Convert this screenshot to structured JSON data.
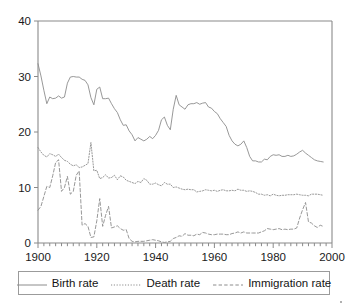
{
  "chart_data": {
    "type": "line",
    "title": "",
    "xlabel": "",
    "ylabel": "",
    "xlim": [
      1900,
      2000
    ],
    "ylim": [
      0,
      40
    ],
    "grid": false,
    "legend_position": "bottom",
    "x_ticks": [
      "1900",
      "1920",
      "1940",
      "1960",
      "1980",
      "2000"
    ],
    "x_tick_values": [
      1900,
      1920,
      1940,
      1960,
      1980,
      2000
    ],
    "y_ticks": [
      "0",
      "10",
      "20",
      "30",
      "40"
    ],
    "y_tick_values": [
      0,
      10,
      20,
      30,
      40
    ],
    "minor_x_tick_step": 2,
    "x": [
      1900,
      1901,
      1902,
      1903,
      1904,
      1905,
      1906,
      1907,
      1908,
      1909,
      1910,
      1911,
      1912,
      1913,
      1914,
      1915,
      1916,
      1917,
      1918,
      1919,
      1920,
      1921,
      1922,
      1923,
      1924,
      1925,
      1926,
      1927,
      1928,
      1929,
      1930,
      1931,
      1932,
      1933,
      1934,
      1935,
      1936,
      1937,
      1938,
      1939,
      1940,
      1941,
      1942,
      1943,
      1944,
      1945,
      1946,
      1947,
      1948,
      1949,
      1950,
      1951,
      1952,
      1953,
      1954,
      1955,
      1956,
      1957,
      1958,
      1959,
      1960,
      1961,
      1962,
      1963,
      1964,
      1965,
      1966,
      1967,
      1968,
      1969,
      1970,
      1971,
      1972,
      1973,
      1974,
      1975,
      1976,
      1977,
      1978,
      1979,
      1980,
      1981,
      1982,
      1983,
      1984,
      1985,
      1986,
      1987,
      1988,
      1989,
      1990,
      1991,
      1992,
      1993,
      1994,
      1995,
      1996,
      1997
    ],
    "series": [
      {
        "name": "Birth rate",
        "style": "solid",
        "values": [
          32.3,
          30.1,
          27.5,
          25.1,
          26.3,
          26.0,
          26.1,
          26.5,
          26.1,
          26.3,
          28.8,
          29.9,
          30.0,
          29.9,
          29.9,
          29.5,
          29.3,
          28.5,
          26.2,
          24.9,
          27.7,
          28.1,
          26.0,
          26.0,
          26.1,
          25.1,
          24.2,
          23.5,
          22.2,
          21.2,
          21.3,
          20.2,
          19.5,
          18.4,
          19.0,
          18.7,
          18.4,
          18.7,
          19.2,
          18.8,
          19.4,
          20.3,
          22.2,
          22.7,
          21.2,
          20.4,
          24.1,
          26.6,
          24.9,
          24.5,
          24.1,
          24.9,
          25.1,
          25.1,
          25.3,
          25.0,
          25.2,
          25.3,
          24.5,
          24.3,
          23.7,
          23.3,
          22.4,
          21.7,
          21.0,
          19.4,
          18.4,
          17.8,
          17.5,
          17.8,
          18.4,
          17.2,
          15.6,
          14.8,
          14.8,
          14.6,
          14.6,
          15.1,
          15.0,
          15.6,
          15.9,
          15.8,
          15.9,
          15.6,
          15.6,
          15.8,
          15.6,
          15.7,
          16.0,
          16.4,
          16.7,
          16.2,
          15.8,
          15.4,
          15.0,
          14.8,
          14.7,
          14.6
        ]
      },
      {
        "name": "Death rate",
        "style": "dotted",
        "values": [
          17.2,
          16.4,
          15.8,
          15.5,
          16.1,
          15.9,
          15.6,
          16.0,
          15.4,
          14.9,
          14.7,
          14.2,
          13.9,
          14.1,
          13.6,
          13.7,
          14.0,
          14.3,
          18.1,
          13.0,
          13.1,
          11.6,
          11.8,
          12.3,
          11.7,
          11.8,
          12.2,
          11.4,
          12.1,
          11.9,
          11.3,
          11.1,
          10.9,
          10.7,
          11.1,
          10.9,
          11.6,
          11.3,
          10.6,
          10.6,
          10.8,
          10.5,
          10.3,
          10.9,
          10.6,
          10.6,
          10.0,
          10.1,
          9.9,
          9.7,
          9.6,
          9.7,
          9.6,
          9.6,
          9.2,
          9.3,
          9.4,
          9.6,
          9.5,
          9.4,
          9.5,
          9.3,
          9.5,
          9.6,
          9.4,
          9.4,
          9.5,
          9.4,
          9.7,
          9.5,
          9.5,
          9.3,
          9.4,
          9.3,
          9.1,
          8.8,
          8.8,
          8.6,
          8.7,
          8.5,
          8.8,
          8.6,
          8.5,
          8.6,
          8.6,
          8.7,
          8.7,
          8.7,
          8.8,
          8.7,
          8.6,
          8.6,
          8.5,
          8.8,
          8.8,
          8.8,
          8.7,
          8.6
        ]
      },
      {
        "name": "Immigration rate",
        "style": "dashed",
        "values": [
          5.9,
          6.6,
          8.4,
          10.2,
          10.0,
          12.1,
          14.5,
          15.0,
          9.3,
          10.0,
          12.0,
          8.8,
          9.3,
          12.2,
          13.0,
          3.2,
          3.5,
          3.0,
          1.0,
          1.1,
          4.0,
          8.0,
          3.0,
          5.0,
          6.6,
          2.7,
          2.9,
          3.1,
          2.6,
          2.3,
          2.4,
          0.8,
          0.3,
          0.2,
          0.3,
          0.3,
          0.3,
          0.4,
          0.5,
          0.6,
          0.5,
          0.4,
          0.2,
          0.1,
          0.2,
          0.3,
          0.8,
          1.0,
          1.3,
          1.2,
          1.7,
          1.4,
          1.4,
          1.3,
          1.6,
          1.5,
          1.9,
          1.8,
          1.6,
          1.5,
          1.5,
          1.6,
          1.6,
          1.6,
          1.5,
          1.5,
          1.7,
          1.8,
          2.0,
          1.8,
          2.0,
          1.8,
          1.8,
          1.8,
          1.8,
          1.8,
          2.0,
          2.2,
          2.6,
          2.5,
          2.4,
          2.5,
          2.6,
          2.4,
          2.5,
          2.4,
          2.5,
          2.5,
          2.7,
          4.5,
          6.0,
          7.3,
          3.8,
          3.6,
          3.1,
          2.8,
          3.2,
          3.0
        ]
      }
    ]
  },
  "legend": {
    "items": [
      {
        "label": "Birth rate",
        "style": "solid"
      },
      {
        "label": "Death rate",
        "style": "dotted"
      },
      {
        "label": "Immigration rate",
        "style": "dashed"
      }
    ]
  },
  "colors": {
    "line": "#8c8c8c",
    "axis": "#8a8a8a",
    "text": "#141414",
    "background": "#ffffff",
    "legend_border": "#9b9b9b"
  }
}
